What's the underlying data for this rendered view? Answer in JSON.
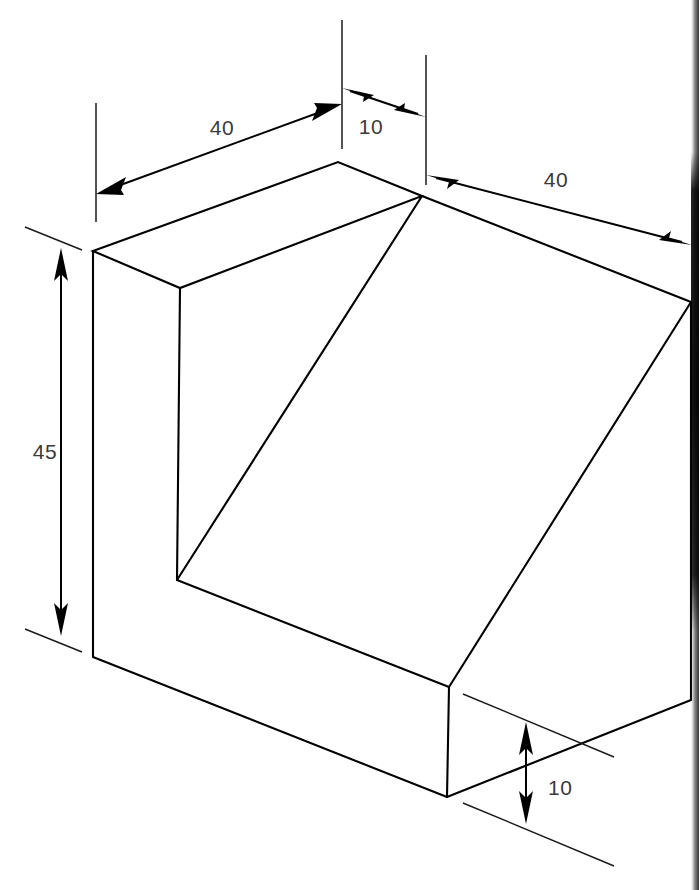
{
  "document": {
    "type": "isometric-technical-drawing",
    "title": "Isometric view of notched block with inclined face",
    "background_color": "#ffffff",
    "line_color": "#000000",
    "text_color": "#3a3a3a",
    "width": 699,
    "height": 890
  },
  "dimensions": [
    {
      "id": "top-left-40",
      "label": "40",
      "text_x": 222,
      "text_y": 135,
      "orientation": "isometric-left",
      "description": "width of left slab along top-left edge"
    },
    {
      "id": "top-middle-10",
      "label": "10",
      "text_x": 371,
      "text_y": 134,
      "orientation": "isometric-left",
      "description": "thickness of left slab"
    },
    {
      "id": "top-right-40",
      "label": "40",
      "text_x": 556,
      "text_y": 187,
      "orientation": "isometric-right",
      "description": "depth along top-right edge"
    },
    {
      "id": "left-vertical-45",
      "label": "45",
      "text_x": 30,
      "text_y": 459,
      "orientation": "vertical",
      "description": "overall height of block"
    },
    {
      "id": "bottom-right-10",
      "label": "10",
      "text_x": 535,
      "text_y": 795,
      "orientation": "vertical",
      "description": "height of bottom base slab"
    }
  ],
  "geometry": {
    "vertices": {
      "top_apex": [
        338,
        162
      ],
      "top_junction": [
        422,
        196
      ],
      "left_top_front": [
        93,
        251
      ],
      "left_inner_top": [
        180,
        288
      ],
      "notch_bottom": [
        177,
        580
      ],
      "left_bottom_front": [
        93,
        657
      ],
      "front_bottom_vertex": [
        447,
        797
      ],
      "slope_base_vertex": [
        449,
        687
      ],
      "right_top_corner": [
        691,
        302
      ],
      "right_bottom_corner": [
        691,
        700
      ]
    },
    "edge_count": 16,
    "faces": [
      "top",
      "left-end",
      "front-vertical",
      "inclined-slope",
      "right-side",
      "base-slab"
    ]
  },
  "artifacts": {
    "right_edge_dark_band": "scanning shadow along right border"
  }
}
